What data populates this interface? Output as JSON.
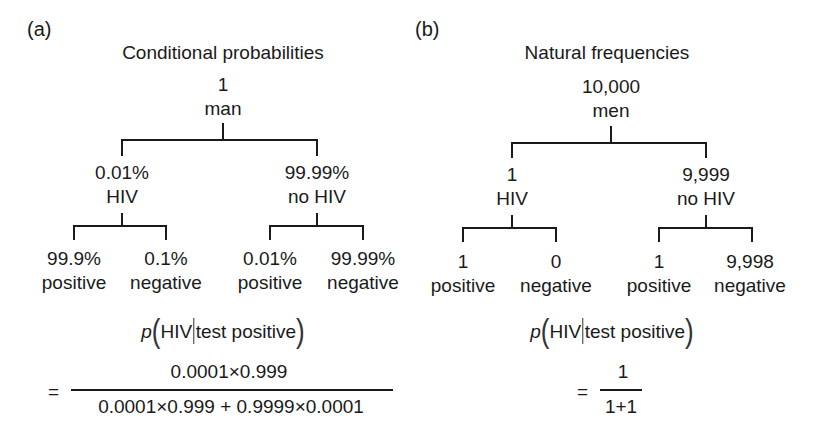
{
  "panels": [
    {
      "label": "(a)",
      "title": "Conditional probabilities",
      "root": {
        "value": "1",
        "label": "man"
      },
      "branches": [
        {
          "value": "0.01%",
          "label": "HIV",
          "leaves": [
            {
              "value": "99.9%",
              "label": "positive"
            },
            {
              "value": "0.1%",
              "label": "negative"
            }
          ]
        },
        {
          "value": "99.99%",
          "label": "no HIV",
          "leaves": [
            {
              "value": "0.01%",
              "label": "positive"
            },
            {
              "value": "99.99%",
              "label": "negative"
            }
          ]
        }
      ],
      "formula": {
        "p": "p",
        "lhs_a": "HIV",
        "lhs_b": "test positive",
        "equals": "=",
        "numerator": "0.0001×0.999",
        "denominator": "0.0001×0.999 + 0.9999×0.0001"
      }
    },
    {
      "label": "(b)",
      "title": "Natural frequencies",
      "root": {
        "value": "10,000",
        "label": "men"
      },
      "branches": [
        {
          "value": "1",
          "label": "HIV",
          "leaves": [
            {
              "value": "1",
              "label": "positive"
            },
            {
              "value": "0",
              "label": "negative"
            }
          ]
        },
        {
          "value": "9,999",
          "label": "no HIV",
          "leaves": [
            {
              "value": "1",
              "label": "positive"
            },
            {
              "value": "9,998",
              "label": "negative"
            }
          ]
        }
      ],
      "formula": {
        "p": "p",
        "lhs_a": "HIV",
        "lhs_b": "test positive",
        "equals": "=",
        "numerator": "1",
        "denominator": "1+1"
      }
    }
  ],
  "colors": {
    "ink": "#1a1a1a",
    "background": "#ffffff"
  }
}
